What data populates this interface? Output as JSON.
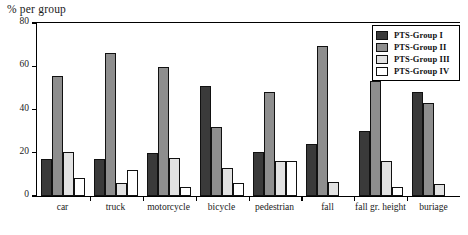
{
  "chart_data": {
    "type": "bar",
    "title": "",
    "ylabel": "% per group",
    "xlabel": "",
    "ylim": [
      0,
      80
    ],
    "yticks": [
      0,
      20,
      40,
      60,
      80
    ],
    "grid": false,
    "legend_position": "top-right",
    "categories": [
      "car",
      "truck",
      "motorcycle",
      "bicycle",
      "pedestrian",
      "fall",
      "fall gr. height",
      "buriage"
    ],
    "series": [
      {
        "name": "PTS-Group I",
        "color": "#3a3a3a",
        "values": [
          17,
          17,
          20,
          51,
          20.5,
          24,
          30,
          48
        ]
      },
      {
        "name": "PTS-Group II",
        "color": "#8e8e8e",
        "values": [
          55.5,
          66,
          59.5,
          32,
          48,
          69.5,
          53,
          43
        ]
      },
      {
        "name": "PTS-Group III",
        "color": "#e2e2e2",
        "values": [
          20.5,
          6,
          17.5,
          13,
          16,
          6.5,
          16,
          5.5
        ]
      },
      {
        "name": "PTS-Group IV",
        "color": "#ffffff",
        "values": [
          8.5,
          12,
          4,
          6,
          16,
          0,
          4,
          0
        ]
      }
    ]
  },
  "legend": {
    "items": [
      {
        "label": "PTS-Group I"
      },
      {
        "label": "PTS-Group II"
      },
      {
        "label": "PTS-Group III"
      },
      {
        "label": "PTS-Group IV"
      }
    ]
  }
}
